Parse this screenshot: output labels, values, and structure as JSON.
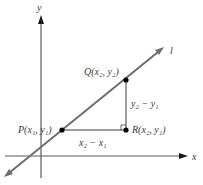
{
  "diagram": {
    "axes": {
      "x_label": "x",
      "y_label": "y"
    },
    "line_label": "l",
    "points": {
      "P": {
        "name": "P",
        "label": "P(x₁, y₁)"
      },
      "Q": {
        "name": "Q",
        "label": "Q(x₂, y₂)"
      },
      "R": {
        "name": "R",
        "label": "R(x₂, y₁)"
      }
    },
    "segments": {
      "run_label": "x₂ − x₁",
      "rise_label": "y₂ − y₁"
    },
    "colors": {
      "line": "#6e6e6e",
      "axis": "#5a5a5a",
      "point": "#000000",
      "text": "#3a3a3a"
    }
  }
}
